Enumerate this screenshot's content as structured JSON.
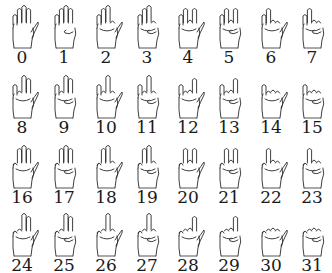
{
  "encoding": {
    "thumb": 1,
    "index": 2,
    "middle": 4,
    "ring": 8,
    "pinky": 16,
    "rule": "bit set = finger folded"
  },
  "layout": {
    "columns": 8,
    "rows": 4
  },
  "gestures": [
    {
      "label": "0"
    },
    {
      "label": "1"
    },
    {
      "label": "2"
    },
    {
      "label": "3"
    },
    {
      "label": "4"
    },
    {
      "label": "5"
    },
    {
      "label": "6"
    },
    {
      "label": "7"
    },
    {
      "label": "8"
    },
    {
      "label": "9"
    },
    {
      "label": "10"
    },
    {
      "label": "11"
    },
    {
      "label": "12"
    },
    {
      "label": "13"
    },
    {
      "label": "14"
    },
    {
      "label": "15"
    },
    {
      "label": "16"
    },
    {
      "label": "17"
    },
    {
      "label": "18"
    },
    {
      "label": "19"
    },
    {
      "label": "20"
    },
    {
      "label": "21"
    },
    {
      "label": "22"
    },
    {
      "label": "23"
    },
    {
      "label": "24"
    },
    {
      "label": "25"
    },
    {
      "label": "26"
    },
    {
      "label": "27"
    },
    {
      "label": "28"
    },
    {
      "label": "29"
    },
    {
      "label": "30"
    },
    {
      "label": "31"
    }
  ],
  "colors": {
    "stroke": "#2a2a2a",
    "fill": "#ffffff",
    "text": "#1a1a1a"
  }
}
